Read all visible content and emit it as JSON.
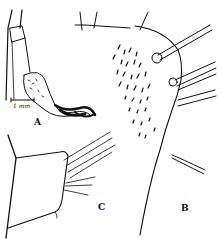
{
  "figure": {
    "panels": [
      {
        "id": "A",
        "label": "A"
      },
      {
        "id": "B",
        "label": "B"
      },
      {
        "id": "C",
        "label": "C"
      }
    ],
    "scale_bar": {
      "label": "1 mm"
    },
    "colors": {
      "ink": "#111111",
      "background": "#ffffff"
    }
  }
}
